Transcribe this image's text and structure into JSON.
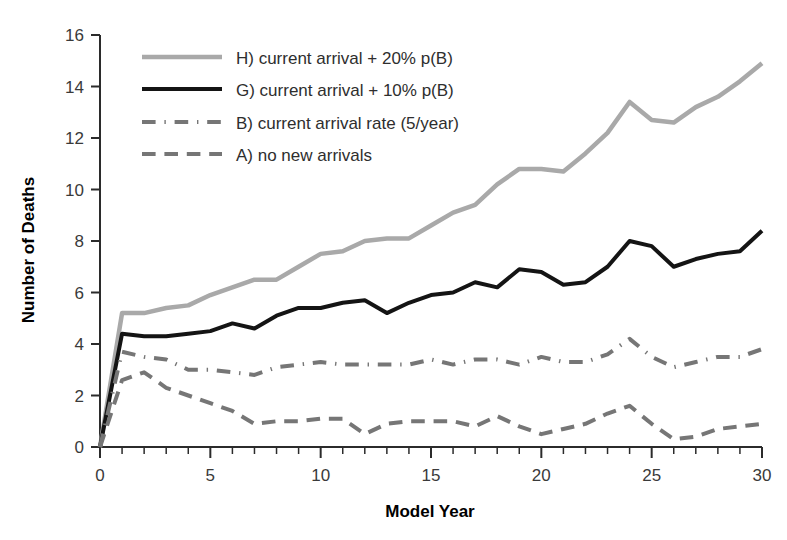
{
  "chart_data": {
    "type": "line",
    "title": "",
    "xlabel": "Model Year",
    "ylabel": "Number of Deaths",
    "xlim": [
      0,
      30
    ],
    "ylim": [
      0,
      16
    ],
    "xticks": [
      0,
      5,
      10,
      15,
      20,
      25,
      30
    ],
    "yticks": [
      0,
      2,
      4,
      6,
      8,
      10,
      12,
      14,
      16
    ],
    "xtick_labels": [
      "0",
      "5",
      "10",
      "15",
      "20",
      "25",
      "30"
    ],
    "ytick_labels": [
      "0",
      "2",
      "4",
      "6",
      "8",
      "10",
      "12",
      "14",
      "16"
    ],
    "xminor_step": 1,
    "grid": false,
    "legend_position": "upper left",
    "x": [
      0,
      1,
      2,
      3,
      4,
      5,
      6,
      7,
      8,
      9,
      10,
      11,
      12,
      13,
      14,
      15,
      16,
      17,
      18,
      19,
      20,
      21,
      22,
      23,
      24,
      25,
      26,
      27,
      28,
      29,
      30
    ],
    "series": [
      {
        "name": "H) current arrival + 20% p(B)",
        "key": "H",
        "color": "#a9a9a9",
        "style": "solid",
        "width": 4.5,
        "values": [
          0,
          5.2,
          5.2,
          5.4,
          5.5,
          5.9,
          6.2,
          6.5,
          6.5,
          7.0,
          7.5,
          7.6,
          8.0,
          8.1,
          8.1,
          8.6,
          9.1,
          9.4,
          10.2,
          10.8,
          10.8,
          10.7,
          11.4,
          12.2,
          13.4,
          12.7,
          12.6,
          13.2,
          13.6,
          14.2,
          14.9
        ]
      },
      {
        "name": "G) current arrival + 10% p(B)",
        "key": "G",
        "color": "#141414",
        "style": "solid",
        "width": 4.0,
        "values": [
          0,
          4.4,
          4.3,
          4.3,
          4.4,
          4.5,
          4.8,
          4.6,
          5.1,
          5.4,
          5.4,
          5.6,
          5.7,
          5.2,
          5.6,
          5.9,
          6.0,
          6.4,
          6.2,
          6.9,
          6.8,
          6.3,
          6.4,
          7.0,
          8.0,
          7.8,
          7.0,
          7.3,
          7.5,
          7.6,
          8.4
        ]
      },
      {
        "name": "B) current arrival rate (5/year)",
        "key": "B",
        "color": "#767676",
        "style": "dashdot",
        "width": 4.0,
        "values": [
          0,
          3.7,
          3.5,
          3.4,
          3.0,
          3.0,
          2.9,
          2.8,
          3.1,
          3.2,
          3.3,
          3.2,
          3.2,
          3.2,
          3.2,
          3.4,
          3.2,
          3.4,
          3.4,
          3.2,
          3.5,
          3.3,
          3.3,
          3.6,
          4.2,
          3.5,
          3.1,
          3.3,
          3.5,
          3.5,
          3.8
        ]
      },
      {
        "name": "A) no new arrivals",
        "key": "A",
        "color": "#767676",
        "style": "dashed",
        "width": 4.0,
        "values": [
          0,
          2.6,
          2.9,
          2.3,
          2.0,
          1.7,
          1.4,
          0.9,
          1.0,
          1.0,
          1.1,
          1.1,
          0.5,
          0.9,
          1.0,
          1.0,
          1.0,
          0.8,
          1.2,
          0.8,
          0.5,
          0.7,
          0.9,
          1.3,
          1.6,
          0.9,
          0.3,
          0.4,
          0.7,
          0.8,
          0.9
        ]
      }
    ],
    "legend": [
      {
        "label": "H) current arrival + 20% p(B)",
        "color": "#a9a9a9",
        "style": "solid"
      },
      {
        "label": "G) current arrival + 10% p(B)",
        "color": "#141414",
        "style": "solid"
      },
      {
        "label": "B) current arrival rate (5/year)",
        "color": "#767676",
        "style": "dashdot"
      },
      {
        "label": "A) no new arrivals",
        "color": "#767676",
        "style": "dashed"
      }
    ]
  },
  "colors": {
    "axis": "#2b2b2b",
    "tick_text": "#3a3a3a",
    "title_text": "#000000",
    "background": "#ffffff"
  }
}
